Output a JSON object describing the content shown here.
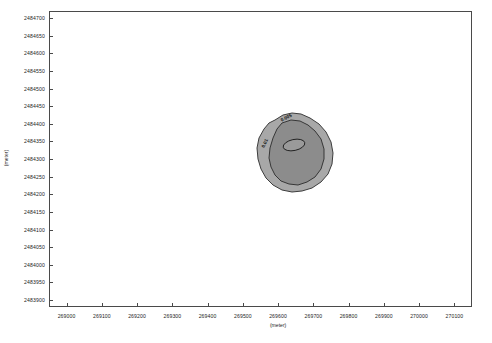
{
  "chart_data": {
    "type": "scatter",
    "title": "",
    "xlabel": "(meter)",
    "ylabel": "(meter)",
    "xlim": [
      268950,
      270150
    ],
    "ylim": [
      2483880,
      2484720
    ],
    "grid": false,
    "legend": null,
    "x_ticks": [
      269000,
      269100,
      269200,
      269300,
      269400,
      269500,
      269600,
      269700,
      269800,
      269900,
      270000,
      270100
    ],
    "x_tick_labels": [
      "269000",
      "269100",
      "269200",
      "269300",
      "269400",
      "269500",
      "269600",
      "269700",
      "269800",
      "269900",
      "270000",
      "270100"
    ],
    "y_ticks": [
      2483900,
      2483950,
      2484000,
      2484050,
      2484100,
      2484150,
      2484200,
      2484250,
      2484300,
      2484350,
      2484400,
      2484450,
      2484500,
      2484550,
      2484600,
      2484650,
      2484700
    ],
    "y_tick_labels": [
      "2483900",
      "2483950",
      "2484000",
      "2484050",
      "2484100",
      "2484150",
      "2484200",
      "2484250",
      "2484300",
      "2484350",
      "2484400",
      "2484450",
      "2484500",
      "2484550",
      "2484600",
      "2484650",
      "2484700"
    ],
    "annotations": [
      {
        "name": "contour-label-outer",
        "text": "0.005",
        "x": 269680,
        "y": 2484395
      },
      {
        "name": "contour-label-inner",
        "text": "0.01",
        "x": 269630,
        "y": 2484315
      }
    ],
    "series": [
      {
        "name": "outer-contour-zone",
        "fill": "#a8a8a8",
        "stroke": "#3d3d3d",
        "centroid": [
          269655,
          2484305
        ],
        "extent_x": [
          269595,
          269790
        ],
        "extent_y": [
          2484190,
          2484420
        ]
      },
      {
        "name": "middle-contour-zone",
        "fill": "#8c8c8c",
        "stroke": "#2b2b2b",
        "centroid": [
          269655,
          2484300
        ],
        "extent_x": [
          269610,
          269755
        ],
        "extent_y": [
          2484215,
          2484400
        ]
      },
      {
        "name": "inner-contour-zone",
        "fill": "#9a9a9a",
        "stroke": "#1f1f1f",
        "centroid": [
          269648,
          2484325
        ],
        "extent_x": [
          269628,
          269672
        ],
        "extent_y": [
          2484312,
          2484338
        ]
      }
    ]
  },
  "colors": {
    "frame": "#4a4a4a",
    "background": "#ffffff",
    "text": "#1c1c1c",
    "fill_outer": "#a8a8a8",
    "fill_middle": "#8c8c8c",
    "fill_inner": "#9a9a9a"
  }
}
